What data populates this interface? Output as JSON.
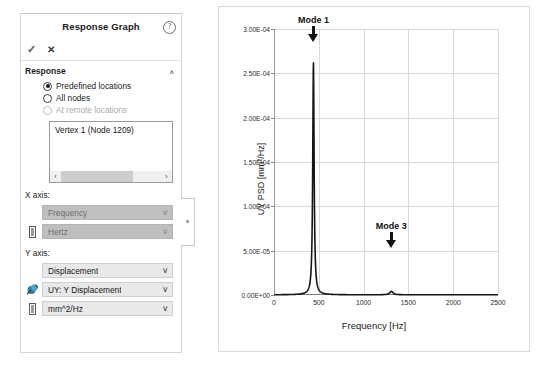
{
  "panel": {
    "title": "Response Graph",
    "help_icon": "question-mark-icon",
    "toolbar": {
      "accept_label": "✓",
      "cancel_label": "✕"
    },
    "section": {
      "label": "Response",
      "collapse_chevron": "∧"
    },
    "radios": [
      {
        "label": "Predefined locations",
        "checked": true,
        "disabled": false
      },
      {
        "label": "All nodes",
        "checked": false,
        "disabled": false
      },
      {
        "label": "At remote locations",
        "checked": false,
        "disabled": true
      }
    ],
    "listbox": {
      "items": [
        "Vertex 1 (Node 1209)"
      ],
      "scroll_left_icon": "‹",
      "scroll_right_icon": "›"
    },
    "x_axis": {
      "label": "X axis:",
      "quantity": {
        "value": "Frequency",
        "disabled": true,
        "icon": ""
      },
      "unit": {
        "value": "Hertz",
        "disabled": true,
        "icon": "unit-icon"
      }
    },
    "y_axis": {
      "label": "Y axis:",
      "quantity": {
        "value": "Displacement",
        "disabled": false,
        "icon": ""
      },
      "component": {
        "value": "UY: Y Displacement",
        "disabled": false,
        "icon": "vector-component-icon"
      },
      "unit": {
        "value": "mm^2/Hz",
        "disabled": false,
        "icon": "unit-icon"
      }
    },
    "chevron_down": "∨",
    "handle_icon": "panel-resize-handle"
  },
  "chart_data": {
    "type": "line",
    "title": "",
    "xlabel": "Frequency [Hz]",
    "ylabel": "UY PSD [mm²/Hz]",
    "xlim": [
      0,
      2500
    ],
    "ylim": [
      0,
      0.0003
    ],
    "grid": true,
    "legend": null,
    "xticks": [
      0,
      500,
      1000,
      1500,
      2000,
      2500
    ],
    "xticklabels": [
      "0",
      "500",
      "1000",
      "1500",
      "2000",
      "2500"
    ],
    "yticks": [
      0,
      5e-05,
      0.0001,
      0.00015,
      0.0002,
      0.00025,
      0.0003
    ],
    "yticklabels": [
      "0.00E+00",
      "5.00E-05",
      "1.00E-04",
      "1.50E-04",
      "2.00E-04",
      "2.50E-04",
      "3.00E-04"
    ],
    "annotations": [
      {
        "text": "Mode 1",
        "x": 440,
        "y": 0.0003,
        "marker": "down-arrow"
      },
      {
        "text": "Mode 3",
        "x": 1310,
        "y": 5.2e-05,
        "marker": "down-arrow"
      }
    ],
    "series": [
      {
        "name": "UY PSD",
        "color": "#161616",
        "peaks": [
          {
            "frequency": 440,
            "amplitude": 0.000264,
            "halfwidth": 9,
            "label": "Mode 1"
          },
          {
            "frequency": 1310,
            "amplitude": 4e-06,
            "halfwidth": 22,
            "label": "Mode 3"
          }
        ],
        "x": [
          0,
          50,
          100,
          150,
          200,
          250,
          300,
          330,
          360,
          390,
          410,
          425,
          435,
          440,
          445,
          455,
          470,
          490,
          520,
          560,
          620,
          700,
          800,
          900,
          1000,
          1100,
          1200,
          1260,
          1300,
          1310,
          1320,
          1360,
          1450,
          1600,
          1800,
          2000,
          2200,
          2400,
          2500
        ],
        "y": [
          2e-07,
          3e-07,
          6e-07,
          1.1e-06,
          2.2e-06,
          4.2e-06,
          9e-06,
          1.5e-05,
          2.9e-05,
          7.5e-05,
          0.000155,
          0.000245,
          0.000262,
          0.000264,
          0.000258,
          0.000195,
          8e-05,
          2.6e-05,
          8e-06,
          3.4e-06,
          1.7e-06,
          1e-06,
          7e-07,
          6e-07,
          6e-07,
          7e-07,
          1.1e-06,
          2.2e-06,
          3.7e-06,
          4e-06,
          3.7e-06,
          2e-06,
          9e-07,
          5e-07,
          4e-07,
          3e-07,
          3e-07,
          2e-07,
          2e-07
        ]
      }
    ]
  }
}
